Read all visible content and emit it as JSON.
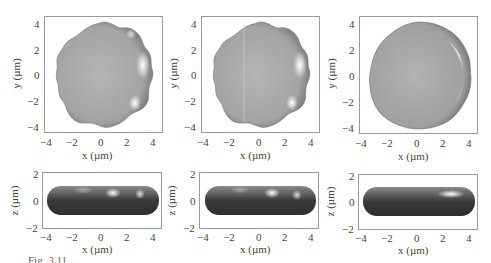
{
  "figure": {
    "caption": "Fig. 3.11 ...",
    "panels_top": [
      {
        "id": "a-top",
        "shape": "wavy-9-lobe",
        "xlabel": "x (µm)",
        "ylabel": "y (µm)",
        "xticks": [
          "−4",
          "−2",
          "0",
          "2",
          "4"
        ],
        "yticks": [
          "4",
          "2",
          "0",
          "−2",
          "−4"
        ]
      },
      {
        "id": "b-top",
        "shape": "wavy-9-lobe",
        "xlabel": "x (µm)",
        "ylabel": "y (µm)",
        "xticks": [
          "−4",
          "−2",
          "0",
          "2",
          "4"
        ],
        "yticks": [
          "4",
          "2",
          "0",
          "−2",
          "−4"
        ]
      },
      {
        "id": "c-top",
        "shape": "rounded-polygon",
        "xlabel": "x (µm)",
        "ylabel": "y (µm)",
        "xticks": [
          "−4",
          "−2",
          "0",
          "2",
          "4"
        ],
        "yticks": [
          "4",
          "2",
          "0",
          "−2",
          "−4"
        ]
      }
    ],
    "panels_bottom": [
      {
        "id": "a-side",
        "xlabel": "x (µm)",
        "ylabel": "z (µm)",
        "xticks": [
          "−4",
          "−2",
          "0",
          "2",
          "4"
        ],
        "yticks": [
          "2",
          "0",
          "−2"
        ]
      },
      {
        "id": "b-side",
        "xlabel": "x (µm)",
        "ylabel": "z (µm)",
        "xticks": [
          "−4",
          "−2",
          "0",
          "2",
          "4"
        ],
        "yticks": [
          "2",
          "0",
          "−2"
        ]
      },
      {
        "id": "c-side",
        "xlabel": "x (µm)",
        "ylabel": "z (µm)",
        "xticks": [
          "−4",
          "−2",
          "0",
          "2",
          "4"
        ],
        "yticks": [
          "2",
          "0",
          "−2"
        ]
      }
    ],
    "axis_ranges": {
      "top": {
        "x": [
          -4.5,
          4.5
        ],
        "y": [
          -4.5,
          4.5
        ]
      },
      "bottom": {
        "x": [
          -4.5,
          4.5
        ],
        "z": [
          -2,
          2
        ]
      }
    },
    "colors": {
      "axis": "#9a9a9a",
      "shape_light": "#d6d6d6",
      "shape_mid": "#a8a8a8",
      "shape_dark": "#3c3c3c",
      "highlight": "#ffffff"
    }
  }
}
